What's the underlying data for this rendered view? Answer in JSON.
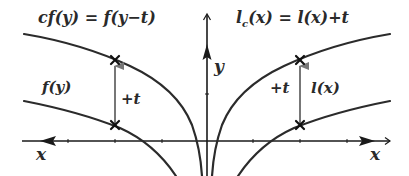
{
  "diagram": {
    "labels": {
      "shifted_f": "cf(y) = f(y−t)",
      "shifted_l": "l⁣c(x) = l(x)+t",
      "shifted_l_main": "l",
      "shifted_l_sub": "c",
      "shifted_l_rest": "(x) = l(x)+t",
      "f": "f(y)",
      "l": "l(x)",
      "shift_left": "+t",
      "shift_right": "+t",
      "x_left": "x",
      "x_right": "x",
      "y": "y"
    },
    "colors": {
      "curve": "#2b2b2b",
      "axis": "#1a1a1a",
      "shift_arrow": "#777777",
      "marker": "#111111",
      "background": "#ffffff"
    },
    "curves": [
      {
        "name": "f(y)",
        "side": "left",
        "description": "lower-left curve, crosses x-axis near x=145 and descends to bottom"
      },
      {
        "name": "cf(y)",
        "side": "left",
        "description": "upper-left curve, f shifted by +t, descends steeply near y-axis"
      },
      {
        "name": "l(x)",
        "side": "right",
        "description": "lower-right curve, crosses x-axis near x=268"
      },
      {
        "name": "l_c(x)",
        "side": "right",
        "description": "upper-right curve, l shifted by +t, descends steeply near y-axis"
      }
    ],
    "markers": [
      {
        "side": "left",
        "position": "lower",
        "symbol": "x"
      },
      {
        "side": "left",
        "position": "upper",
        "symbol": "x"
      },
      {
        "side": "right",
        "position": "lower",
        "symbol": "x"
      },
      {
        "side": "right",
        "position": "upper",
        "symbol": "x"
      }
    ]
  }
}
